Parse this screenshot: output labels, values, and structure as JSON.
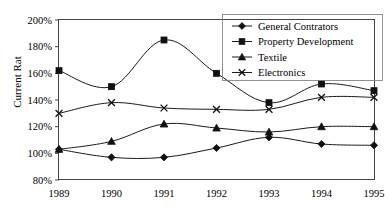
{
  "chart_data": {
    "type": "line",
    "title": "",
    "xlabel": "",
    "ylabel": "Current Rat",
    "categories": [
      "1989",
      "1990",
      "1991",
      "1992",
      "1993",
      "1994",
      "1995"
    ],
    "x": [
      1989,
      1990,
      1991,
      1992,
      1993,
      1994,
      1995
    ],
    "ylim": [
      80,
      200
    ],
    "ytick_labels": [
      "200%",
      "180%",
      "160%",
      "140%",
      "120%",
      "100%",
      "80%"
    ],
    "ytick_values": [
      200,
      180,
      160,
      140,
      120,
      100,
      80
    ],
    "yunit": "%",
    "grid": false,
    "legend_position": "top-right",
    "series": [
      {
        "name": "General Contrators",
        "marker": "diamond",
        "values": [
          103,
          97,
          97,
          104,
          112,
          107,
          106
        ]
      },
      {
        "name": "Property Development",
        "marker": "square",
        "values": [
          162,
          150,
          185,
          160,
          138,
          152,
          147
        ]
      },
      {
        "name": "Textile",
        "marker": "triangle",
        "values": [
          103,
          109,
          122,
          119,
          116,
          120,
          120
        ]
      },
      {
        "name": "Electronics",
        "marker": "cross-x",
        "values": [
          130,
          138,
          134,
          133,
          133,
          142,
          142
        ]
      }
    ]
  },
  "axes": {
    "y_title": "Current Rat",
    "y_ticks": [
      "200%",
      "180%",
      "160%",
      "140%",
      "120%",
      "100%",
      "80%"
    ],
    "x_ticks": [
      "1989",
      "1990",
      "1991",
      "1992",
      "1993",
      "1994",
      "1995"
    ]
  },
  "legend": {
    "entries": [
      {
        "label": "General Contrators",
        "marker": "diamond-marker-icon"
      },
      {
        "label": "Property Development",
        "marker": "square-marker-icon"
      },
      {
        "label": "Textile",
        "marker": "triangle-marker-icon"
      },
      {
        "label": "Electronics",
        "marker": "x-marker-icon"
      }
    ]
  },
  "colors": {
    "series": "#111111",
    "axis": "#444444",
    "background": "#ffffff"
  }
}
